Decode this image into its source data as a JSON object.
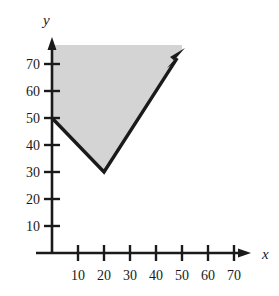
{
  "figure": {
    "background_color": "#ffffff",
    "axis_color": "#1a1a1a",
    "curve_color": "#1a1a1a",
    "shade_color": "#d4d4d4"
  },
  "axes": {
    "x_label": "x",
    "y_label": "y",
    "x_ticks": [
      "10",
      "20",
      "30",
      "40",
      "50",
      "60",
      "70"
    ],
    "y_ticks": [
      "10",
      "20",
      "30",
      "40",
      "50",
      "60",
      "70"
    ]
  },
  "chart_data": {
    "type": "line",
    "title": "",
    "xlabel": "x",
    "ylabel": "y",
    "xlim": [
      0,
      78
    ],
    "ylim": [
      0,
      80
    ],
    "grid": false,
    "legend": null,
    "x_ticks": [
      10,
      20,
      30,
      40,
      50,
      60,
      70
    ],
    "y_ticks": [
      10,
      20,
      30,
      40,
      50,
      60,
      70
    ],
    "series": [
      {
        "name": "v-shaped-boundary",
        "type": "line",
        "style": "solid-thick-with-arrow",
        "arrow_at_end": true,
        "points": [
          {
            "x": 0,
            "y": 50
          },
          {
            "x": 20,
            "y": 30
          },
          {
            "x": 50,
            "y": 75
          }
        ]
      }
    ],
    "shaded_region": {
      "name": "region-above-v",
      "description": "Region above the V-shaped boundary, bounded left by the y-axis and clipped at the top of the plotting area",
      "fill": "#d4d4d4",
      "vertices": [
        {
          "x": 0,
          "y": 50
        },
        {
          "x": 20,
          "y": 30
        },
        {
          "x": 50,
          "y": 75
        },
        {
          "x": 50,
          "y": 75
        },
        {
          "x": 0,
          "y": 75
        }
      ]
    },
    "annotations": []
  }
}
